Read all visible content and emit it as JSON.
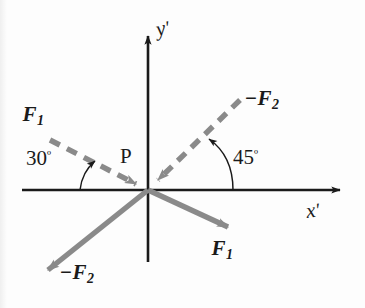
{
  "figure": {
    "type": "vector-force-diagram",
    "background_color": "#fdfdfd",
    "axis_color": "#1a1a1a",
    "vector_color": "#8a8a8a",
    "origin": {
      "x": 148,
      "y": 190,
      "label": "P"
    },
    "axes": [
      {
        "name": "x-prime-axis",
        "label": "x",
        "prime": "′",
        "from": {
          "x": 22,
          "y": 190
        },
        "to": {
          "x": 348,
          "y": 190
        },
        "label_position": {
          "x": 305,
          "y": 204
        }
      },
      {
        "name": "y-prime-axis",
        "label": "y",
        "prime": "′",
        "from": {
          "x": 148,
          "y": 262
        },
        "to": {
          "x": 148,
          "y": 28
        },
        "label_position": {
          "x": 155,
          "y": 20
        }
      }
    ],
    "vectors": [
      {
        "name": "f1-dashed",
        "label": "F",
        "subscript": "1",
        "sign": "",
        "style": "dashed",
        "color": "#8a8a8a",
        "angle_deg": 30,
        "direction": "toward-origin",
        "from": {
          "x": 50,
          "y": 140
        },
        "to": {
          "x": 148,
          "y": 190
        },
        "label_position": {
          "x": 22,
          "y": 105
        }
      },
      {
        "name": "neg-f2-dashed",
        "label": "F",
        "subscript": "2",
        "sign": "−",
        "style": "dashed",
        "color": "#8a8a8a",
        "angle_deg": 45,
        "direction": "toward-origin",
        "from": {
          "x": 240,
          "y": 100
        },
        "to": {
          "x": 148,
          "y": 190
        },
        "label_position": {
          "x": 246,
          "y": 90
        }
      },
      {
        "name": "f1-solid",
        "label": "F",
        "subscript": "1",
        "sign": "",
        "style": "solid",
        "color": "#8a8a8a",
        "angle_deg": -30,
        "direction": "away-from-origin",
        "from": {
          "x": 148,
          "y": 190
        },
        "to": {
          "x": 238,
          "y": 232
        },
        "label_position": {
          "x": 211,
          "y": 240
        }
      },
      {
        "name": "neg-f2-solid",
        "label": "F",
        "subscript": "2",
        "sign": "−",
        "style": "solid",
        "color": "#8a8a8a",
        "angle_deg": -135,
        "direction": "away-from-origin",
        "from": {
          "x": 148,
          "y": 190
        },
        "to": {
          "x": 38,
          "y": 278
        },
        "label_position": {
          "x": 60,
          "y": 264
        }
      }
    ],
    "angles": [
      {
        "name": "angle-30",
        "value": "30",
        "degree_symbol": "º",
        "between": "x-prime-axis-negative-side and f1-dashed",
        "arc_from": {
          "x": 78,
          "y": 190
        },
        "arc_to": {
          "x": 98,
          "y": 164
        },
        "label_position": {
          "x": 27,
          "y": 150
        }
      },
      {
        "name": "angle-45",
        "value": "45",
        "degree_symbol": "º",
        "between": "x-prime-axis-positive-side and neg-f2-dashed",
        "arc_from": {
          "x": 232,
          "y": 190
        },
        "arc_to": {
          "x": 206,
          "y": 141
        },
        "label_position": {
          "x": 234,
          "y": 149
        }
      }
    ]
  }
}
